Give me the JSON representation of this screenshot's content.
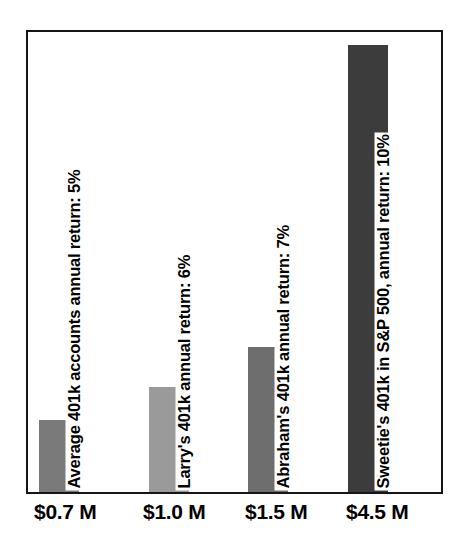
{
  "chart_data": {
    "type": "bar",
    "title": "",
    "subtitle": "",
    "xlabel": "",
    "ylabel": "",
    "grid": false,
    "legend": "none",
    "orientation": "vertical",
    "ylim": [
      0,
      4.9
    ],
    "categories": [
      "$0.7 M",
      "$1.0 M",
      "$1.5 M",
      "$4.5 M"
    ],
    "values": [
      0.7,
      1.0,
      1.5,
      4.5
    ],
    "value_unit": "millions of dollars",
    "tick_labels": [
      "$0.7 M",
      "$1.0 M",
      "$1.5 M",
      "$4.5 M"
    ],
    "annotations": [
      "Average 401k accounts annual return: 5%",
      "Larry's 401k annual return: 6%",
      "Abraham's 401k annual return: 7%",
      "Sweetie's 401k in S&P 500, annual return: 10%"
    ],
    "bars": [
      {
        "id": "bar-average-401k",
        "tick_label": "$0.7 M",
        "value": 0.7,
        "annual_return": "5%",
        "caption": "Average 401k accounts annual return: 5%",
        "color": "#7a7a7a",
        "left_pct": 2.6,
        "height_pct": 15.7
      },
      {
        "id": "bar-larry-401k",
        "tick_label": "$1.0 M",
        "value": 1.0,
        "annual_return": "6%",
        "caption": "Larry's 401k annual return: 6%",
        "color": "#9a9a9a",
        "left_pct": 29.3,
        "height_pct": 22.9
      },
      {
        "id": "bar-abraham-401k",
        "tick_label": "$1.5 M",
        "value": 1.5,
        "annual_return": "7%",
        "caption": "Abraham's 401k annual return: 7%",
        "color": "#6e6e6e",
        "left_pct": 53.2,
        "height_pct": 31.6
      },
      {
        "id": "bar-sweetie-sp500",
        "tick_label": "$4.5 M",
        "value": 4.5,
        "annual_return": "10%",
        "caption": "Sweetie's 401k in S&P 500, annual return: 10%",
        "color": "#3c3c3c",
        "left_pct": 77.5,
        "height_pct": 97.2
      }
    ],
    "colors": {
      "frame": "#151515",
      "background": "#ffffff",
      "text": "#000000"
    }
  }
}
